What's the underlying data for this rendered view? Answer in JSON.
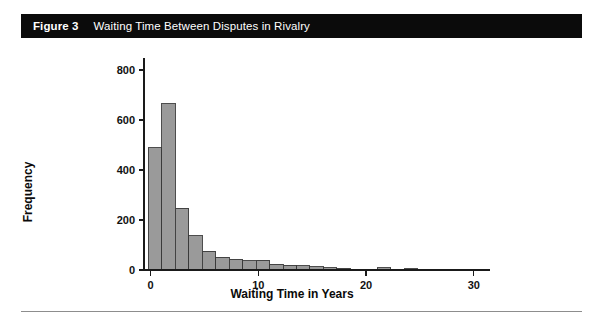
{
  "banner": {
    "figure_label": "Figure 3",
    "title": "Waiting Time Between Disputes in Rivalry",
    "background_color": "#0b0b0b",
    "text_color": "#ffffff"
  },
  "chart_data": {
    "type": "bar",
    "title": "Waiting Time Between Disputes in Rivalry",
    "xlabel": "Waiting Time in Years",
    "ylabel": "Frequency",
    "xlim": [
      -0.6,
      31.5
    ],
    "ylim": [
      0,
      840
    ],
    "xticks": [
      0,
      10,
      20,
      30
    ],
    "xtick_labels": [
      "0",
      "10",
      "20",
      "30"
    ],
    "yticks": [
      0,
      200,
      400,
      600,
      800
    ],
    "ytick_labels": [
      "0",
      "200",
      "400",
      "600",
      "800"
    ],
    "grid": false,
    "legend": null,
    "bar_color": "#9a9a9a",
    "bar_edge_color": "#3a3a3a",
    "bin_width": 1.25,
    "bin_starts": [
      -0.2,
      1.05,
      2.3,
      3.55,
      4.8,
      6.05,
      7.3,
      8.55,
      9.8,
      11.05,
      12.3,
      13.55,
      14.8,
      16.05,
      17.3,
      18.55,
      19.8,
      21.05,
      22.3,
      23.55,
      24.8,
      26.05,
      27.3,
      28.55
    ],
    "categories": [
      "0.4",
      "1.7",
      "2.9",
      "4.2",
      "5.4",
      "6.7",
      "7.9",
      "9.2",
      "10.4",
      "11.7",
      "12.9",
      "14.2",
      "15.4",
      "16.7",
      "17.9",
      "19.2",
      "20.4",
      "21.7",
      "22.9",
      "24.2",
      "25.4",
      "26.7",
      "27.9",
      "29.2"
    ],
    "values": [
      490,
      665,
      248,
      138,
      76,
      52,
      44,
      38,
      40,
      24,
      20,
      18,
      14,
      9,
      7,
      4,
      2,
      10,
      2,
      6,
      0,
      4,
      2,
      0
    ]
  },
  "axes": {
    "y_axis_title": "Frequency",
    "x_axis_title": "Waiting Time in Years"
  }
}
